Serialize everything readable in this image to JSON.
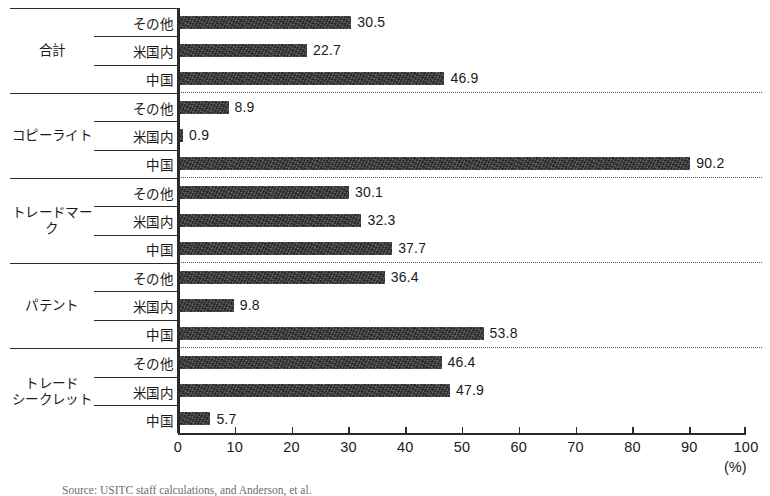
{
  "chart_data": {
    "type": "bar",
    "orientation": "horizontal",
    "title": "",
    "xlabel": "(%)",
    "ylabel": "",
    "xlim": [
      0,
      100
    ],
    "xticks": [
      0,
      10,
      20,
      30,
      40,
      50,
      60,
      70,
      80,
      90,
      100
    ],
    "xtick_labels": [
      "0",
      "10",
      "20",
      "30",
      "40",
      "50",
      "60",
      "70",
      "80",
      "90",
      "100"
    ],
    "grid": false,
    "legend": "none",
    "series_names": [
      "その他",
      "米国内",
      "中国"
    ],
    "categories": [
      "合計",
      "コピーライト",
      "トレードマーク",
      "パテント",
      "トレード\nシークレット"
    ],
    "groups": [
      {
        "category": "合計",
        "bars": [
          {
            "label": "その他",
            "value": 30.5,
            "value_text": "30.5"
          },
          {
            "label": "米国内",
            "value": 22.7,
            "value_text": "22.7"
          },
          {
            "label": "中国",
            "value": 46.9,
            "value_text": "46.9"
          }
        ]
      },
      {
        "category": "コピーライト",
        "bars": [
          {
            "label": "その他",
            "value": 8.9,
            "value_text": "8.9"
          },
          {
            "label": "米国内",
            "value": 0.9,
            "value_text": "0.9"
          },
          {
            "label": "中国",
            "value": 90.2,
            "value_text": "90.2"
          }
        ]
      },
      {
        "category": "トレードマーク",
        "bars": [
          {
            "label": "その他",
            "value": 30.1,
            "value_text": "30.1"
          },
          {
            "label": "米国内",
            "value": 32.3,
            "value_text": "32.3"
          },
          {
            "label": "中国",
            "value": 37.7,
            "value_text": "37.7"
          }
        ]
      },
      {
        "category": "パテント",
        "bars": [
          {
            "label": "その他",
            "value": 36.4,
            "value_text": "36.4"
          },
          {
            "label": "米国内",
            "value": 9.8,
            "value_text": "9.8"
          },
          {
            "label": "中国",
            "value": 53.8,
            "value_text": "53.8"
          }
        ]
      },
      {
        "category": "トレード\nシークレット",
        "bars": [
          {
            "label": "その他",
            "value": 46.4,
            "value_text": "46.4"
          },
          {
            "label": "米国内",
            "value": 47.9,
            "value_text": "47.9"
          },
          {
            "label": "中国",
            "value": 5.7,
            "value_text": "5.7"
          }
        ]
      }
    ],
    "colors": {
      "bar": "#262626",
      "axis": "#2a2a2a",
      "separator": "#555555",
      "background": "#ffffff"
    }
  },
  "axis": {
    "unit": "(%)"
  },
  "source_note": {
    "text": "Source: USITC staff calculations, and Anderson, et al."
  }
}
